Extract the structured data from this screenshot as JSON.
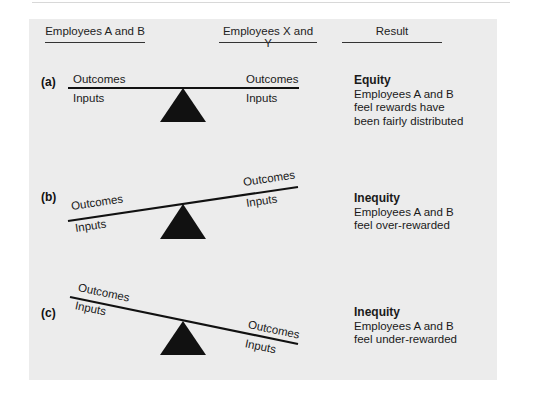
{
  "headers": {
    "left": "Employees A and B",
    "middle": "Employees X and Y",
    "right": "Result"
  },
  "rows": [
    {
      "label": "(a)",
      "left_top": "Outcomes",
      "left_bottom": "Inputs",
      "right_top": "Outcomes",
      "right_bottom": "Inputs",
      "result_title": "Equity",
      "result_lines": [
        "Employees A and B",
        "feel rewards have",
        "been fairly distributed"
      ]
    },
    {
      "label": "(b)",
      "left_top": "Outcomes",
      "left_bottom": "Inputs",
      "right_top": "Outcomes",
      "right_bottom": "Inputs",
      "result_title": "Inequity",
      "result_lines": [
        "Employees A and B",
        "feel over-rewarded"
      ]
    },
    {
      "label": "(c)",
      "left_top": "Outcomes",
      "left_bottom": "Inputs",
      "right_top": "Outcomes",
      "right_bottom": "Inputs",
      "result_title": "Inequity",
      "result_lines": [
        "Employees A and B",
        "feel under-rewarded"
      ]
    }
  ],
  "colors": {
    "panel_bg": "#ececec",
    "ink": "#111111"
  }
}
